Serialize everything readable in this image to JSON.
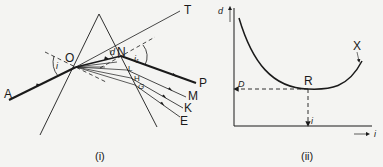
{
  "figure_i": {
    "caption": "(i)",
    "labels": {
      "A": "A",
      "O": "O",
      "N": "N",
      "T": "T",
      "P": "P",
      "L": "L",
      "H": "H",
      "G": "G",
      "M": "M",
      "K": "K",
      "E": "E",
      "angle_i": "i",
      "angle_i1": "i₁",
      "angle_d": "d"
    },
    "description": "Prism with incident ray AO refracting at O, emerging at N toward P; dispersed rays emerge via L, H, G toward M, K, E; OT is the extended incident direction."
  },
  "figure_ii": {
    "caption": "(ii)",
    "labels": {
      "y_axis": "d",
      "x_axis": "i",
      "min_point": "R",
      "min_deviation": "D",
      "min_incidence": "i",
      "curve_end": "X"
    },
    "description": "Angle of deviation d versus angle of incidence i; U-shaped curve with minimum at R giving minimum deviation D."
  },
  "colors": {
    "background": "#f4f4f2",
    "ink": "#1a1a1a"
  }
}
